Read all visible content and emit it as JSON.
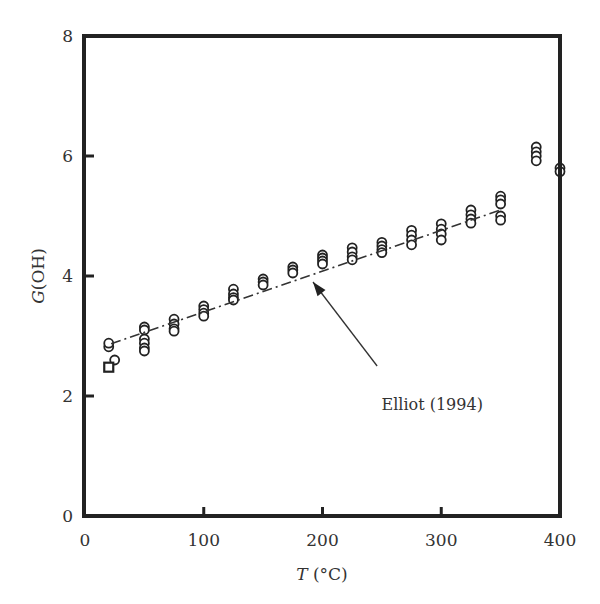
{
  "chart_data": {
    "type": "scatter",
    "title": "",
    "xlabel": "T (°C)",
    "xlabel_italic": "T",
    "xlabel_unit": " (°C)",
    "ylabel": "G(OH)",
    "ylabel_italic": "G",
    "ylabel_rest": "(OH)",
    "xlim": [
      0,
      400
    ],
    "ylim": [
      0,
      8
    ],
    "xticks": [
      0,
      100,
      200,
      300,
      400
    ],
    "yticks": [
      0,
      2,
      4,
      6,
      8
    ],
    "grid": false,
    "legend": null,
    "series": [
      {
        "name": "circles",
        "marker": "circle",
        "points": [
          [
            20,
            2.82
          ],
          [
            20,
            2.88
          ],
          [
            25,
            2.6
          ],
          [
            50,
            3.15
          ],
          [
            50,
            3.1
          ],
          [
            50,
            2.95
          ],
          [
            50,
            2.88
          ],
          [
            50,
            2.8
          ],
          [
            50,
            2.75
          ],
          [
            75,
            3.28
          ],
          [
            75,
            3.2
          ],
          [
            75,
            3.12
          ],
          [
            75,
            3.08
          ],
          [
            100,
            3.5
          ],
          [
            100,
            3.44
          ],
          [
            100,
            3.38
          ],
          [
            100,
            3.33
          ],
          [
            125,
            3.78
          ],
          [
            125,
            3.7
          ],
          [
            125,
            3.64
          ],
          [
            125,
            3.6
          ],
          [
            150,
            3.95
          ],
          [
            150,
            3.9
          ],
          [
            150,
            3.85
          ],
          [
            175,
            4.15
          ],
          [
            175,
            4.1
          ],
          [
            175,
            4.05
          ],
          [
            200,
            4.35
          ],
          [
            200,
            4.3
          ],
          [
            200,
            4.25
          ],
          [
            200,
            4.2
          ],
          [
            225,
            4.47
          ],
          [
            225,
            4.4
          ],
          [
            225,
            4.32
          ],
          [
            225,
            4.27
          ],
          [
            250,
            4.56
          ],
          [
            250,
            4.5
          ],
          [
            250,
            4.44
          ],
          [
            250,
            4.39
          ],
          [
            275,
            4.76
          ],
          [
            275,
            4.68
          ],
          [
            275,
            4.6
          ],
          [
            275,
            4.52
          ],
          [
            300,
            4.87
          ],
          [
            300,
            4.78
          ],
          [
            300,
            4.7
          ],
          [
            300,
            4.6
          ],
          [
            325,
            5.1
          ],
          [
            325,
            5.02
          ],
          [
            325,
            4.95
          ],
          [
            325,
            4.88
          ],
          [
            350,
            5.33
          ],
          [
            350,
            5.27
          ],
          [
            350,
            5.2
          ],
          [
            350,
            5.0
          ],
          [
            350,
            4.93
          ],
          [
            380,
            6.15
          ],
          [
            380,
            6.07
          ],
          [
            380,
            6.0
          ],
          [
            380,
            5.92
          ],
          [
            400,
            5.8
          ],
          [
            400,
            5.74
          ]
        ]
      },
      {
        "name": "squares",
        "marker": "square",
        "points": [
          [
            20,
            2.48
          ]
        ]
      }
    ],
    "reference_line": {
      "name": "Elliot (1994)",
      "style": "dash-dot",
      "points": [
        [
          22,
          2.87
        ],
        [
          350,
          5.1
        ]
      ]
    },
    "annotation": {
      "text": "Elliot (1994)",
      "text_at": [
        248,
        1.85
      ],
      "arrow_from": [
        246,
        2.5
      ],
      "arrow_to": [
        192,
        3.9
      ]
    }
  }
}
